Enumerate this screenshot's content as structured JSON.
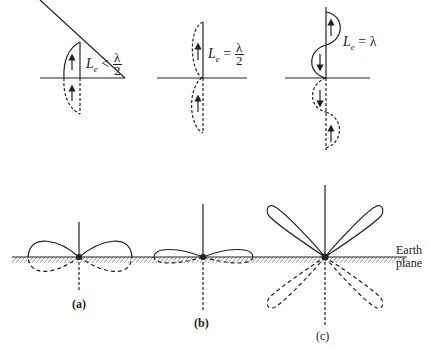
{
  "top_row": [
    {
      "id": "a",
      "length_label": "L",
      "sub": "e",
      "relation": "<",
      "value_num": "λ",
      "value_den": "2"
    },
    {
      "id": "b",
      "length_label": "L",
      "sub": "e",
      "relation": "=",
      "value_num": "λ",
      "value_den": "2"
    },
    {
      "id": "c",
      "length_label": "L",
      "sub": "e",
      "relation": "=",
      "value": "λ"
    }
  ],
  "bottom_row": [
    {
      "caption": "(a)"
    },
    {
      "caption": "(b)"
    },
    {
      "caption": "(c)"
    }
  ],
  "earth_plane_label_line1": "Earth",
  "earth_plane_label_line2": "plane",
  "colors": {
    "ink": "#222222",
    "background": "#ffffff"
  }
}
